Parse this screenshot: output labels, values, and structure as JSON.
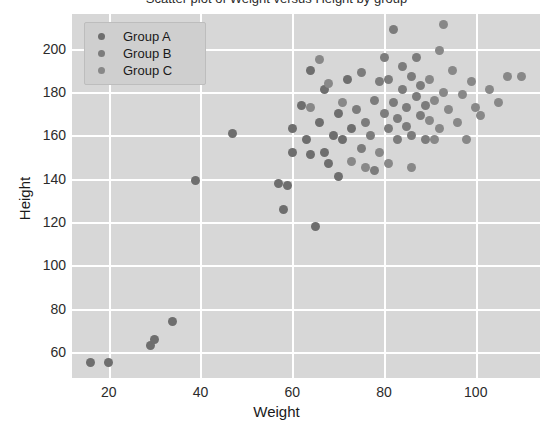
{
  "chart_data": {
    "type": "scatter",
    "title": "Scatter plot of Weight versus Height by group",
    "xlabel": "Weight",
    "ylabel": "Height",
    "xlim": [
      12,
      114
    ],
    "ylim": [
      48,
      216
    ],
    "xticks": [
      20,
      40,
      60,
      80,
      100
    ],
    "yticks": [
      60,
      80,
      100,
      120,
      140,
      160,
      180,
      200
    ],
    "grid": true,
    "legend_position": "upper left",
    "legend": [
      "Group A",
      "Group B",
      "Group C"
    ],
    "colors": {
      "group_a": "#6e6e6e",
      "group_b": "#7c7c7c",
      "group_c": "#888888",
      "plot_background": "#d7d7d7",
      "gridline": "#ffffff",
      "figure_background": "#ffffff",
      "text": "#2b2b2b"
    },
    "series": [
      {
        "name": "Group A",
        "color": "#6e6e6e",
        "points": [
          [
            16,
            55
          ],
          [
            20,
            55
          ],
          [
            29,
            63
          ],
          [
            30,
            66
          ],
          [
            34,
            74
          ],
          [
            39,
            139
          ],
          [
            47,
            161
          ],
          [
            57,
            138
          ],
          [
            58,
            126
          ],
          [
            59,
            137
          ],
          [
            60,
            163
          ],
          [
            60,
            152
          ],
          [
            62,
            174
          ],
          [
            63,
            158
          ],
          [
            64,
            151
          ],
          [
            64,
            190
          ],
          [
            65,
            118
          ],
          [
            66,
            166
          ],
          [
            67,
            152
          ],
          [
            67,
            181
          ],
          [
            68,
            147
          ],
          [
            69,
            160
          ],
          [
            70,
            170
          ],
          [
            70,
            141
          ],
          [
            71,
            158
          ],
          [
            72,
            186
          ],
          [
            73,
            163
          ]
        ]
      },
      {
        "name": "Group B",
        "color": "#7c7c7c",
        "points": [
          [
            74,
            172
          ],
          [
            75,
            154
          ],
          [
            75,
            189
          ],
          [
            76,
            166
          ],
          [
            77,
            160
          ],
          [
            78,
            176
          ],
          [
            78,
            144
          ],
          [
            79,
            185
          ],
          [
            80,
            170
          ],
          [
            80,
            196
          ],
          [
            81,
            163
          ],
          [
            81,
            186
          ],
          [
            82,
            209
          ],
          [
            82,
            175
          ],
          [
            83,
            168
          ],
          [
            83,
            158
          ],
          [
            84,
            181
          ],
          [
            84,
            192
          ],
          [
            85,
            164
          ],
          [
            85,
            173
          ],
          [
            86,
            187
          ],
          [
            86,
            160
          ],
          [
            87,
            178
          ],
          [
            87,
            196
          ],
          [
            88,
            169
          ],
          [
            88,
            183
          ],
          [
            89,
            158
          ],
          [
            89,
            174
          ]
        ]
      },
      {
        "name": "Group C",
        "color": "#888888",
        "points": [
          [
            90,
            186
          ],
          [
            90,
            167
          ],
          [
            91,
            176
          ],
          [
            92,
            199
          ],
          [
            92,
            163
          ],
          [
            93,
            211
          ],
          [
            93,
            180
          ],
          [
            94,
            172
          ],
          [
            95,
            190
          ],
          [
            96,
            166
          ],
          [
            97,
            179
          ],
          [
            98,
            158
          ],
          [
            99,
            185
          ],
          [
            100,
            173
          ],
          [
            101,
            169
          ],
          [
            103,
            181
          ],
          [
            105,
            175
          ],
          [
            107,
            187
          ],
          [
            110,
            187
          ],
          [
            66,
            195
          ],
          [
            71,
            175
          ],
          [
            76,
            145
          ],
          [
            79,
            152
          ],
          [
            81,
            147
          ],
          [
            64,
            173
          ],
          [
            68,
            184
          ],
          [
            73,
            148
          ],
          [
            86,
            145
          ],
          [
            91,
            158
          ]
        ]
      }
    ]
  }
}
